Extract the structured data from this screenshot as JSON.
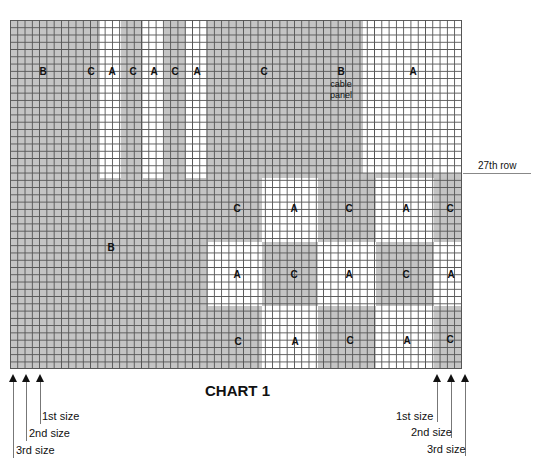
{
  "chart": {
    "title": "CHART 1",
    "row_marker": "27th row",
    "grid": {
      "columns": 62,
      "rows": 48
    },
    "colors": {
      "shaded": "#c4c4c4",
      "white": "#ffffff",
      "gridline": "#555555"
    },
    "upper_labels": [
      {
        "text": "B",
        "x": 43,
        "y": 72
      },
      {
        "text": "C",
        "x": 91,
        "y": 72
      },
      {
        "text": "A",
        "x": 112,
        "y": 72
      },
      {
        "text": "C",
        "x": 133,
        "y": 72
      },
      {
        "text": "A",
        "x": 154,
        "y": 72
      },
      {
        "text": "C",
        "x": 175,
        "y": 72
      },
      {
        "text": "A",
        "x": 197,
        "y": 72
      },
      {
        "text": "C",
        "x": 264,
        "y": 72
      },
      {
        "text": "B",
        "x": 341,
        "y": 72
      },
      {
        "text": "A",
        "x": 413,
        "y": 72
      }
    ],
    "cable_panel_label": "cable panel",
    "lower_left_label": {
      "text": "B",
      "x": 111,
      "y": 248
    },
    "checker_labels": [
      [
        "C",
        "A",
        "C",
        "A",
        "C"
      ],
      [
        "A",
        "C",
        "A",
        "C",
        "A"
      ],
      [
        "C",
        "A",
        "C",
        "A",
        "C"
      ]
    ],
    "left_sizes": [
      "1st size",
      "2nd size",
      "3rd size"
    ],
    "right_sizes": [
      "1st size",
      "2nd size",
      "3rd size"
    ]
  }
}
